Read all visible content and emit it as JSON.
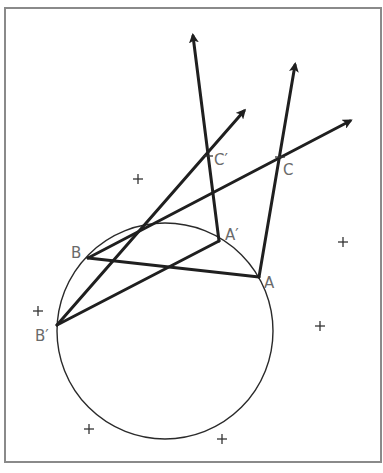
{
  "figure": {
    "labels": {
      "A": "A",
      "A_prime": "A′",
      "B": "B",
      "B_prime": "B′",
      "C": "C",
      "C_prime": "C′"
    },
    "segments": [
      {
        "name": "B-to-A",
        "from": "B",
        "to": "A",
        "arrow": false
      },
      {
        "name": "Bprime-to-Aprime",
        "from": "B_prime",
        "to": "A_prime",
        "arrow": false
      },
      {
        "name": "Aprime-through-Cprime",
        "from": "A_prime",
        "to": "Cprime_ray_end",
        "arrow": true
      },
      {
        "name": "A-through-C",
        "from": "A",
        "to": "C_ray_end",
        "arrow": true
      },
      {
        "name": "Bprime-through-Cprime",
        "from": "B_prime",
        "to": "Cprime_ray_end2",
        "arrow": true
      },
      {
        "name": "B-through-C",
        "from": "B",
        "to": "C_ray_end2",
        "arrow": true
      }
    ],
    "plus_marker_count": 7,
    "colors": {
      "line": "#1f1f1f",
      "label": "#6a6a6a",
      "frame": "#8a8a8a",
      "background": "#ffffff"
    }
  }
}
